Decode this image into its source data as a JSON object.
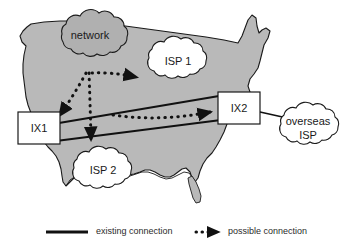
{
  "figure": {
    "kind": "network-topology-over-us-map",
    "background_color": "#ffffff",
    "map_fill_color": "#b9b9b9",
    "map_stroke_color": "#1a1a1a",
    "line_color": "#111111",
    "text_color": "#1a1a1a"
  },
  "clouds": [
    {
      "id": "network",
      "label": "network",
      "label_line2": "",
      "fill": "#b0b0b0",
      "cx": 90,
      "cy": 45
    },
    {
      "id": "isp1",
      "label": "ISP 1",
      "label_line2": "",
      "fill": "#ffffff",
      "cx": 177,
      "cy": 62
    },
    {
      "id": "isp2",
      "label": "ISP 2",
      "label_line2": "",
      "fill": "#ffffff",
      "cx": 105,
      "cy": 172
    },
    {
      "id": "overseas-isp",
      "label": "overseas",
      "label_line2": "ISP",
      "fill": "#ffffff",
      "cx": 306,
      "cy": 128
    }
  ],
  "boxes": [
    {
      "id": "ix1",
      "label": "IX1",
      "x": 18,
      "y": 112,
      "w": 42,
      "h": 32
    },
    {
      "id": "ix2",
      "label": "IX2",
      "x": 218,
      "y": 92,
      "w": 42,
      "h": 32
    }
  ],
  "existing_connections": [
    {
      "from": "ix1",
      "to": "ix2",
      "style": "solid",
      "path": "upper"
    },
    {
      "from": "ix1",
      "to": "ix2",
      "style": "solid",
      "path": "lower"
    },
    {
      "from": "ix2",
      "to": "overseas-isp",
      "style": "solid",
      "path": "direct"
    }
  ],
  "possible_connections": [
    {
      "from": "network",
      "to": "ix1",
      "style": "dotted-arrow"
    },
    {
      "from": "network",
      "to": "isp2",
      "style": "dotted-arrow"
    },
    {
      "from": "network",
      "to": "isp1",
      "style": "dotted-arrow"
    },
    {
      "from": "ix1-ix2-link",
      "to": "ix2",
      "style": "dotted-arrow"
    }
  ],
  "legend": {
    "items": [
      {
        "id": "existing",
        "label": "existing connection",
        "style": "solid-line"
      },
      {
        "id": "possible",
        "label": "possible connection",
        "style": "dotted-arrow"
      }
    ]
  }
}
